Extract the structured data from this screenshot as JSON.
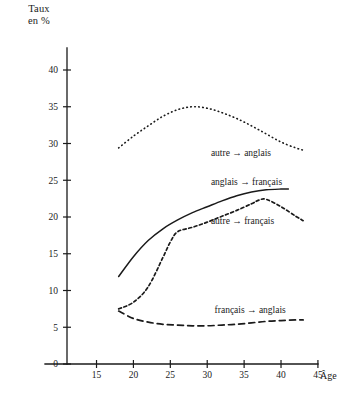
{
  "chart_data": {
    "type": "line",
    "title": "",
    "ylabel_line1": "Taux",
    "ylabel_line2": "en %",
    "xlabel": "Âge",
    "xlim": [
      11,
      49
    ],
    "ylim": [
      0,
      42
    ],
    "grid": false,
    "legend_position": "inline-right",
    "xticks": [
      15,
      20,
      25,
      30,
      35,
      40,
      45
    ],
    "yticks": [
      0,
      5,
      10,
      15,
      20,
      25,
      30,
      35,
      40
    ],
    "series": [
      {
        "name": "autre → anglais",
        "style": "dotted",
        "label_x": 30.5,
        "label_y": 28.8,
        "x": [
          18,
          20,
          22,
          24,
          26,
          28,
          30,
          32,
          34,
          36,
          38,
          40,
          42,
          43
        ],
        "values": [
          29.4,
          31.0,
          32.4,
          33.7,
          34.6,
          35.0,
          34.8,
          34.2,
          33.4,
          32.4,
          31.3,
          30.2,
          29.4,
          29.1
        ]
      },
      {
        "name": "anglais → français",
        "style": "solid",
        "label_x": 30.5,
        "label_y": 24.8,
        "x": [
          18,
          20,
          22,
          24,
          26,
          28,
          30,
          32,
          34,
          36,
          38,
          40,
          41
        ],
        "values": [
          11.9,
          14.6,
          16.8,
          18.4,
          19.6,
          20.6,
          21.4,
          22.2,
          22.9,
          23.4,
          23.7,
          23.8,
          23.8
        ]
      },
      {
        "name": "autre → français",
        "style": "dashed-fine",
        "label_x": 30.5,
        "label_y": 19.5,
        "x": [
          18,
          20,
          22,
          24,
          25,
          26,
          28,
          30,
          32,
          34,
          36,
          37,
          38,
          40,
          42,
          43
        ],
        "values": [
          7.5,
          8.4,
          10.5,
          14.5,
          16.6,
          18.0,
          18.6,
          19.3,
          20.1,
          20.9,
          21.8,
          22.3,
          22.4,
          21.4,
          20.1,
          19.5
        ]
      },
      {
        "name": "français → anglais",
        "style": "dashed-long",
        "label_x": 31.0,
        "label_y": 7.4,
        "x": [
          18,
          20,
          22,
          24,
          26,
          28,
          30,
          32,
          34,
          36,
          38,
          40,
          42,
          43
        ],
        "values": [
          7.2,
          6.2,
          5.7,
          5.4,
          5.3,
          5.2,
          5.2,
          5.3,
          5.4,
          5.6,
          5.8,
          5.9,
          6.0,
          6.0
        ]
      }
    ]
  }
}
